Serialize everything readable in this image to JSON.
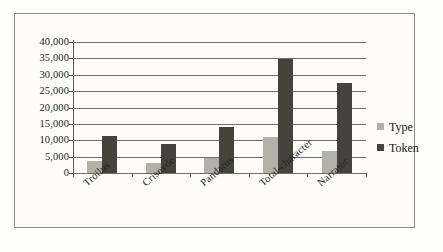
{
  "chart_data": {
    "type": "bar",
    "title": "",
    "xlabel": "",
    "ylabel": "",
    "categories": [
      "Troilus",
      "Criseyde",
      "Pandarus",
      "Total-character",
      "Narrator"
    ],
    "series": [
      {
        "name": "Type",
        "color": "#b3b0a7",
        "values": [
          3600,
          3000,
          4700,
          11000,
          6700
        ]
      },
      {
        "name": "Token",
        "color": "#46433c",
        "values": [
          11300,
          8900,
          14200,
          34700,
          27400
        ]
      }
    ],
    "ylim": [
      0,
      40000
    ],
    "ytick_values": [
      0,
      5000,
      10000,
      15000,
      20000,
      25000,
      30000,
      35000,
      40000
    ],
    "ytick_labels": [
      "0",
      "5,000",
      "10,000",
      "15,000",
      "20,000",
      "25,000",
      "30,000",
      "35,000",
      "40,000"
    ],
    "grid": true,
    "legend_position": "right",
    "legend_entries": [
      "Type",
      "Token"
    ]
  }
}
